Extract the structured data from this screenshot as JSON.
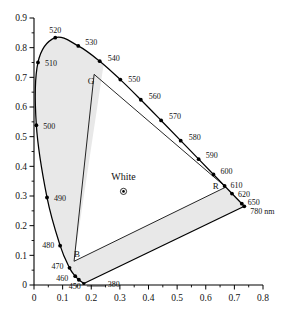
{
  "chart_data": {
    "type": "scatter",
    "title": "",
    "xlabel": "",
    "ylabel": "",
    "xlim": [
      0,
      0.8
    ],
    "ylim": [
      0,
      0.9
    ],
    "grid": false,
    "legend": "none",
    "x_ticks": [
      "0",
      "0.1",
      "0.2",
      "0.3",
      "0.4",
      "0.5",
      "0.6",
      "0.7",
      "0.8"
    ],
    "x_tick_values": [
      0,
      0.1,
      0.2,
      0.3,
      0.4,
      0.5,
      0.6,
      0.7,
      0.8
    ],
    "y_ticks": [
      "0",
      "0.1",
      "0.2",
      "0.3",
      "0.4",
      "0.5",
      "0.6",
      "0.7",
      "0.8",
      "0.9"
    ],
    "y_tick_values": [
      0,
      0.1,
      0.2,
      0.3,
      0.4,
      0.5,
      0.6,
      0.7,
      0.8,
      0.9
    ],
    "minor_ticks": true,
    "spectral_locus": [
      {
        "wavelength": 380,
        "x": 0.1741,
        "y": 0.005
      },
      {
        "wavelength": 450,
        "x": 0.1566,
        "y": 0.0177
      },
      {
        "wavelength": 460,
        "x": 0.144,
        "y": 0.0297
      },
      {
        "wavelength": 470,
        "x": 0.1241,
        "y": 0.0578
      },
      {
        "wavelength": 480,
        "x": 0.0913,
        "y": 0.1327
      },
      {
        "wavelength": 490,
        "x": 0.0454,
        "y": 0.295
      },
      {
        "wavelength": 500,
        "x": 0.0082,
        "y": 0.5384
      },
      {
        "wavelength": 510,
        "x": 0.0139,
        "y": 0.7502
      },
      {
        "wavelength": 520,
        "x": 0.0743,
        "y": 0.8338
      },
      {
        "wavelength": 530,
        "x": 0.1547,
        "y": 0.8059
      },
      {
        "wavelength": 540,
        "x": 0.2296,
        "y": 0.7543
      },
      {
        "wavelength": 550,
        "x": 0.3016,
        "y": 0.6923
      },
      {
        "wavelength": 560,
        "x": 0.3731,
        "y": 0.6245
      },
      {
        "wavelength": 570,
        "x": 0.4441,
        "y": 0.5547
      },
      {
        "wavelength": 580,
        "x": 0.5125,
        "y": 0.4866
      },
      {
        "wavelength": 590,
        "x": 0.5752,
        "y": 0.4242
      },
      {
        "wavelength": 600,
        "x": 0.627,
        "y": 0.3725
      },
      {
        "wavelength": 610,
        "x": 0.6658,
        "y": 0.334
      },
      {
        "wavelength": 620,
        "x": 0.6915,
        "y": 0.3083
      },
      {
        "wavelength": 650,
        "x": 0.726,
        "y": 0.274
      },
      {
        "wavelength": 780,
        "x": 0.7347,
        "y": 0.2653
      }
    ],
    "wavelength_labels": [
      {
        "text": "380",
        "wl": 380
      },
      {
        "text": "450",
        "wl": 450
      },
      {
        "text": "460",
        "wl": 460
      },
      {
        "text": "470",
        "wl": 470
      },
      {
        "text": "480",
        "wl": 480
      },
      {
        "text": "490",
        "wl": 490
      },
      {
        "text": "500",
        "wl": 500
      },
      {
        "text": "510",
        "wl": 510
      },
      {
        "text": "520",
        "wl": 520
      },
      {
        "text": "530",
        "wl": 530
      },
      {
        "text": "540",
        "wl": 540
      },
      {
        "text": "550",
        "wl": 550
      },
      {
        "text": "560",
        "wl": 560
      },
      {
        "text": "570",
        "wl": 570
      },
      {
        "text": "580",
        "wl": 580
      },
      {
        "text": "590",
        "wl": 590
      },
      {
        "text": "600",
        "wl": 600
      },
      {
        "text": "610",
        "wl": 610
      },
      {
        "text": "620",
        "wl": 620
      },
      {
        "text": "650",
        "wl": 650
      },
      {
        "text": "780 nm",
        "wl": 780
      }
    ],
    "gamut_primaries": [
      {
        "name": "R",
        "x": 0.67,
        "y": 0.33
      },
      {
        "name": "G",
        "x": 0.21,
        "y": 0.71
      },
      {
        "name": "B",
        "x": 0.14,
        "y": 0.08
      }
    ],
    "white_point": {
      "name": "White",
      "x": 0.3127,
      "y": 0.329
    },
    "shaded_region_color": "#e8e8e8",
    "locus_color": "#000000",
    "axis_color": "#000000"
  },
  "labels": {
    "white": "White",
    "r": "R",
    "g": "G",
    "b": "B"
  }
}
